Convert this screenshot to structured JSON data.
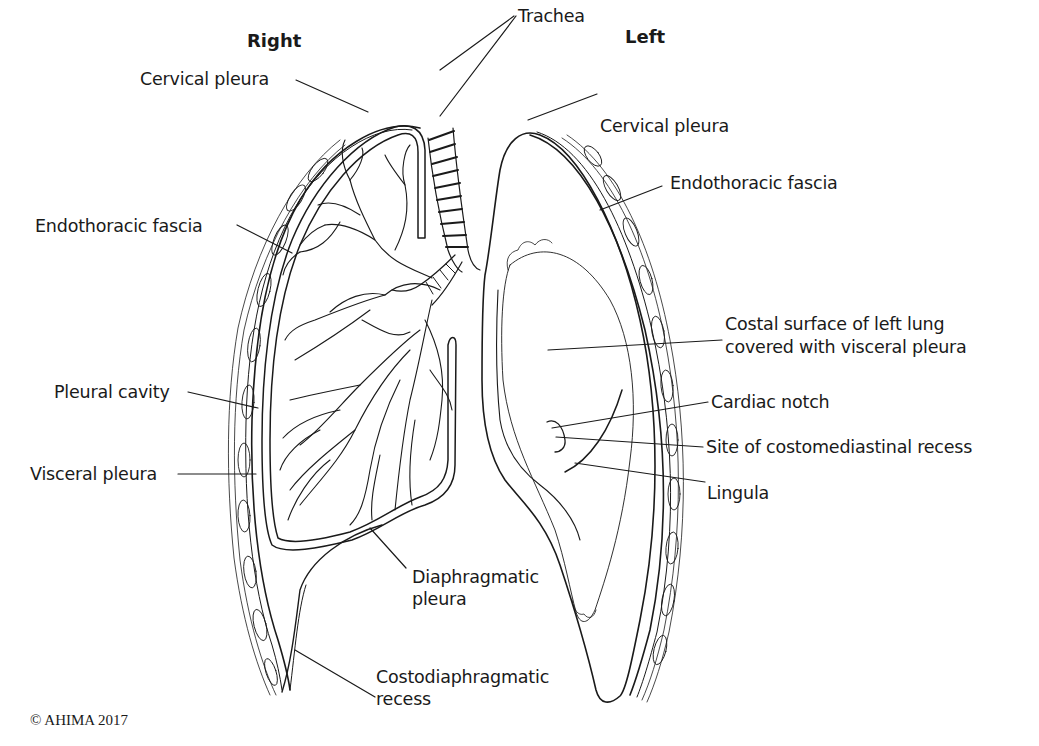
{
  "headings": {
    "right": "Right",
    "left": "Left"
  },
  "labels": {
    "right_side": {
      "cervical_pleura": "Cervical pleura",
      "endothoracic_fascia": "Endothoracic fascia",
      "pleural_cavity": "Pleural cavity",
      "visceral_pleura": "Visceral pleura",
      "diaphragmatic_pleura_line1": "Diaphragmatic",
      "diaphragmatic_pleura_line2": "pleura",
      "costodiaphragmatic_recess_line1": "Costodiaphragmatic",
      "costodiaphragmatic_recess_line2": "recess"
    },
    "left_side": {
      "trachea": "Trachea",
      "cervical_pleura": "Cervical pleura",
      "endothoracic_fascia": "Endothoracic fascia",
      "costal_surface_line1": "Costal surface of left lung",
      "costal_surface_line2": "covered with visceral pleura",
      "cardiac_notch": "Cardiac notch",
      "costomediastinal_recess": "Site of costomediastinal recess",
      "lingula": "Lingula"
    }
  },
  "copyright": "© AHIMA 2017",
  "colors": {
    "stroke": "#1a1a1a",
    "background": "#ffffff"
  }
}
